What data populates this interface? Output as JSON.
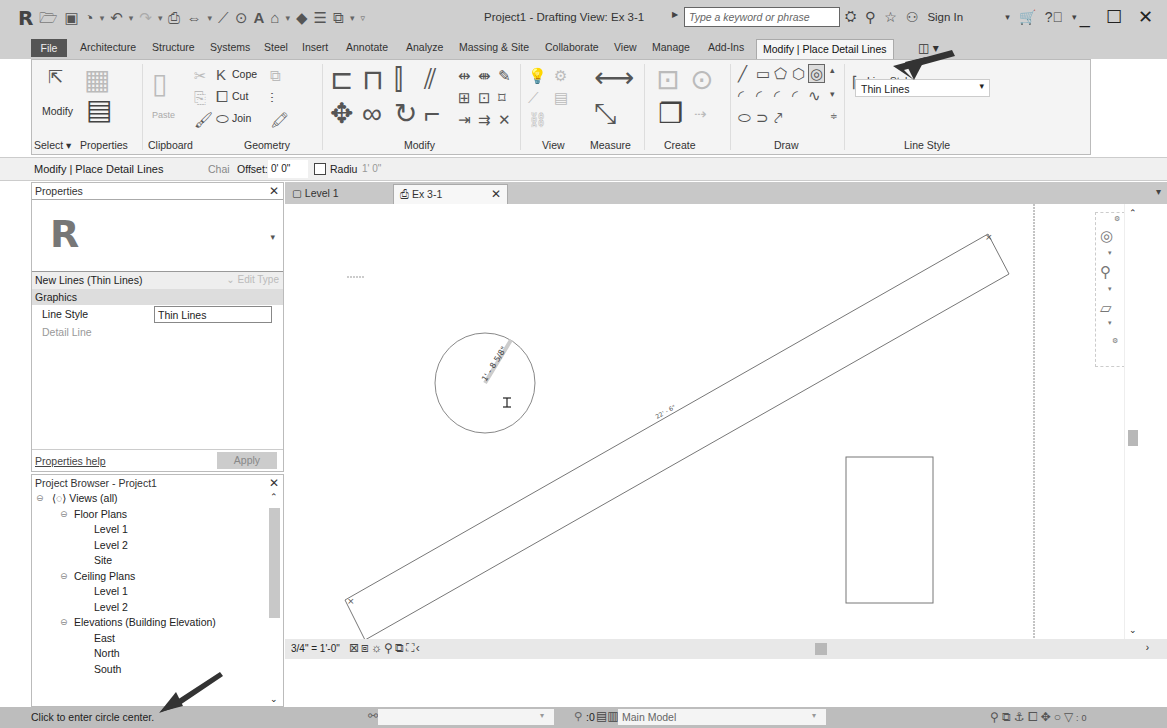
{
  "app": {
    "logo": "R",
    "window_title": "Project1 - Drafting View: Ex 3-1",
    "search_placeholder": "Type a keyword or phrase",
    "sign_in": "Sign In",
    "window_controls": [
      "minimize",
      "maximize",
      "close"
    ]
  },
  "quick_access_toolbar": [
    "open-icon",
    "save-icon",
    "sync-icon",
    "undo-icon",
    "redo-icon",
    "print-icon",
    "measure-icon",
    "dimension-icon",
    "tag-icon",
    "text-icon",
    "3d-view-icon",
    "section-icon",
    "thin-lines-icon",
    "switch-windows-icon",
    "customize-icon"
  ],
  "ribbon_tabs": [
    {
      "label": "File"
    },
    {
      "label": "Architecture"
    },
    {
      "label": "Structure"
    },
    {
      "label": "Systems"
    },
    {
      "label": "Steel"
    },
    {
      "label": "Insert"
    },
    {
      "label": "Annotate"
    },
    {
      "label": "Analyze"
    },
    {
      "label": "Massing & Site"
    },
    {
      "label": "Collaborate"
    },
    {
      "label": "View"
    },
    {
      "label": "Manage"
    },
    {
      "label": "Add-Ins"
    },
    {
      "label": "Modify | Place Detail Lines",
      "active": true
    }
  ],
  "ribbon": {
    "select": {
      "button": "Modify",
      "label": "Select ▾"
    },
    "properties": {
      "label": "Properties"
    },
    "clipboard": {
      "paste": "Paste",
      "label": "Clipboard"
    },
    "geometry": {
      "cope": "Cope",
      "cut": "Cut",
      "join": "Join",
      "label": "Geometry"
    },
    "modify": {
      "label": "Modify"
    },
    "view": {
      "label": "View"
    },
    "measure": {
      "label": "Measure"
    },
    "create": {
      "label": "Create"
    },
    "draw": {
      "label": "Draw",
      "active_tool": "circle-icon"
    },
    "line_style": {
      "caption": "Line Style:",
      "value": "Thin Lines",
      "label": "Line Style"
    }
  },
  "options_bar": {
    "context": "Modify | Place Detail Lines",
    "chain_label": "Chai",
    "offset_label": "Offset:",
    "offset_value": "0' 0\"",
    "radius_label": "Radiu",
    "radius_checked": false,
    "radius_value": "1' 0\""
  },
  "properties_panel": {
    "title": "Properties",
    "type_selector": "New Lines (Thin Lines)",
    "edit_type": "Edit Type",
    "group": "Graphics",
    "rows": [
      {
        "key": "Line Style",
        "value": "Thin Lines"
      },
      {
        "key": "Detail Line",
        "value": ""
      }
    ],
    "help_link": "Properties help",
    "apply": "Apply"
  },
  "project_browser": {
    "title": "Project Browser - Project1",
    "tree": [
      {
        "label": "Views (all)",
        "level": 0,
        "toggle": "−",
        "icon": true
      },
      {
        "label": "Floor Plans",
        "level": 1,
        "toggle": "−"
      },
      {
        "label": "Level 1",
        "level": 2
      },
      {
        "label": "Level 2",
        "level": 2
      },
      {
        "label": "Site",
        "level": 2
      },
      {
        "label": "Ceiling Plans",
        "level": 1,
        "toggle": "−"
      },
      {
        "label": "Level 1",
        "level": 2
      },
      {
        "label": "Level 2",
        "level": 2
      },
      {
        "label": "Elevations (Building Elevation)",
        "level": 1,
        "toggle": "−"
      },
      {
        "label": "East",
        "level": 2
      },
      {
        "label": "North",
        "level": 2
      },
      {
        "label": "South",
        "level": 2
      }
    ]
  },
  "view_tabs": [
    {
      "label": "Level 1",
      "active": false
    },
    {
      "label": "Ex 3-1",
      "active": true
    }
  ],
  "canvas": {
    "circle_dimension": "1' - 8 5/8\"",
    "rotated_rect_label": "22' - 6\""
  },
  "view_control_bar": {
    "scale": "3/4\" = 1'-0\""
  },
  "status_bar": {
    "message": "Click to enter circle center.",
    "editing_count": ":0",
    "design_option": "Main Model",
    "filter_count": ":0"
  },
  "colors": {
    "chrome": "#cfcfcf",
    "ribbon_bg": "#f4f4f4",
    "status_bg": "#bdbdbd",
    "annotation_arrow": "#333333"
  }
}
